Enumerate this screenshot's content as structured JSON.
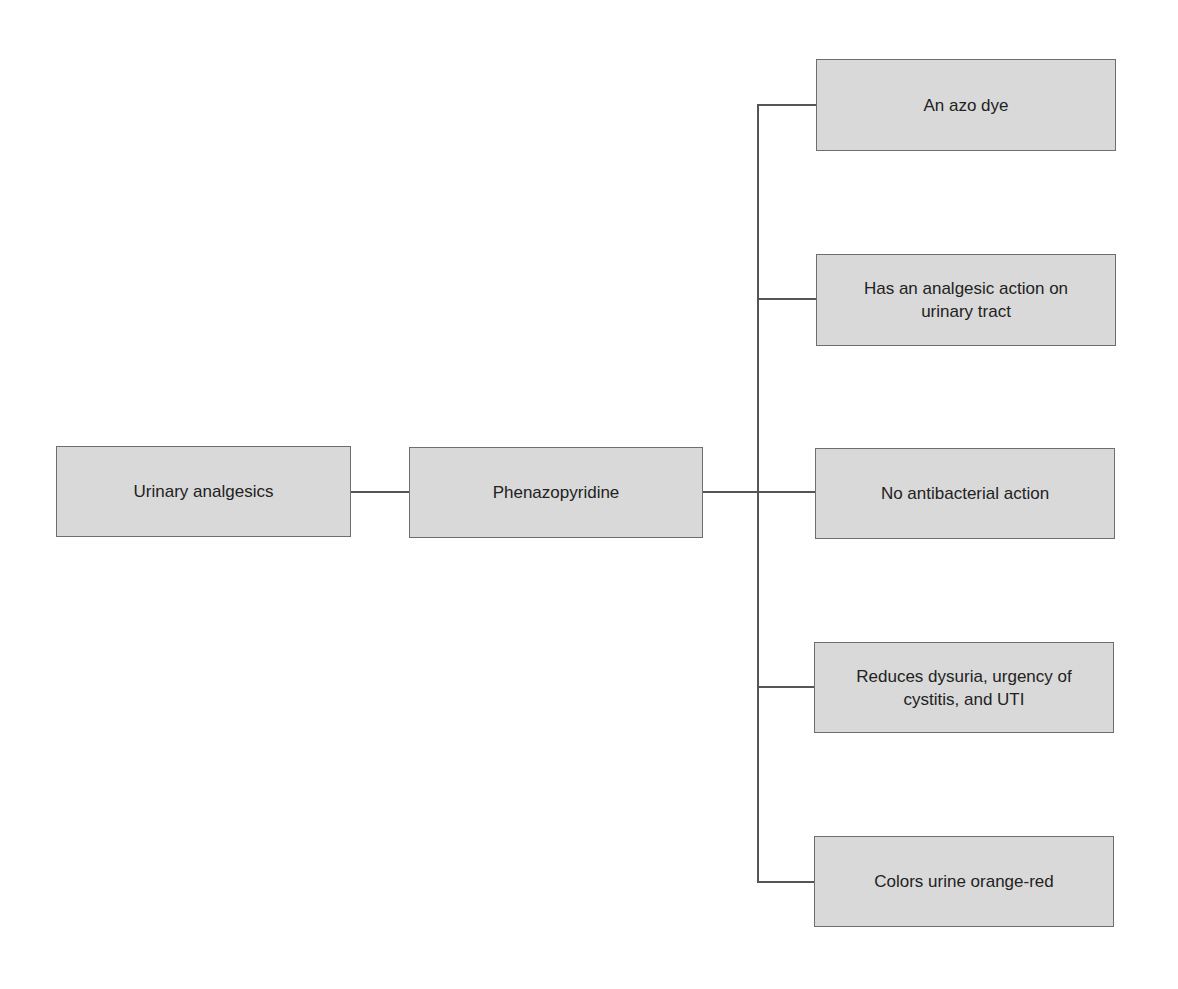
{
  "diagram": {
    "root": {
      "label": "Urinary analgesics"
    },
    "drug": {
      "label": "Phenazopyridine"
    },
    "properties": [
      {
        "label": "An azo dye"
      },
      {
        "label": "Has an analgesic action on urinary tract"
      },
      {
        "label": "No antibacterial action"
      },
      {
        "label": "Reduces dysuria, urgency of cystitis, and UTI"
      },
      {
        "label": "Colors urine orange-red"
      }
    ]
  }
}
